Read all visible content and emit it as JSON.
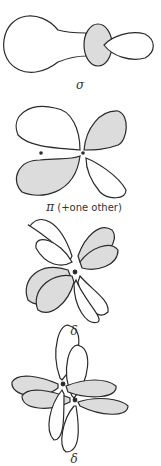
{
  "figure": {
    "colors": {
      "stroke": "#2a2a2a",
      "shaded": "#dcdcdc",
      "unshaded": "#ffffff"
    },
    "panels": [
      {
        "id": "sigma",
        "label": "σ"
      },
      {
        "id": "pi",
        "label": "π",
        "note": "(+one other)"
      },
      {
        "id": "delta1",
        "label": "δ"
      },
      {
        "id": "delta2",
        "label": "δ"
      }
    ]
  }
}
